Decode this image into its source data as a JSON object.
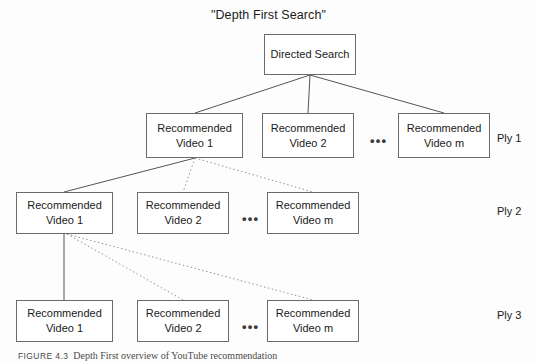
{
  "figure": {
    "title": "\"Depth First Search\"",
    "caption_number": "FIGURE 4.3",
    "caption_text": "Depth First overview of YouTube recommendation",
    "ellipsis": "•••"
  },
  "root": {
    "label": "Directed Search",
    "x": 264,
    "y": 34,
    "w": 92,
    "h": 41
  },
  "plies": [
    {
      "label": "Ply 1",
      "label_x": 497,
      "label_y": 132,
      "box_y": 113,
      "box_h": 45,
      "nodes": [
        {
          "line1": "Recommended",
          "line2": "Video 1",
          "x": 146,
          "w": 97
        },
        {
          "line1": "Recommended",
          "line2": "Video 2",
          "x": 262,
          "w": 92
        },
        {
          "line1": "Recommended",
          "line2": "Video m",
          "x": 398,
          "w": 92
        }
      ],
      "ellipsis_x": 370,
      "ellipsis_y": 134
    },
    {
      "label": "Ply 2",
      "label_x": 497,
      "label_y": 205,
      "box_y": 192,
      "box_h": 42,
      "nodes": [
        {
          "line1": "Recommended",
          "line2": "Video 1",
          "x": 16,
          "w": 97
        },
        {
          "line1": "Recommended",
          "line2": "Video 2",
          "x": 137,
          "w": 92
        },
        {
          "line1": "Recommended",
          "line2": "Video m",
          "x": 267,
          "w": 92
        }
      ],
      "ellipsis_x": 242,
      "ellipsis_y": 212
    },
    {
      "label": "Ply 3",
      "label_x": 497,
      "label_y": 309,
      "box_y": 300,
      "box_h": 42,
      "nodes": [
        {
          "line1": "Recommended",
          "line2": "Video 1",
          "x": 16,
          "w": 97
        },
        {
          "line1": "Recommended",
          "line2": "Video 2",
          "x": 137,
          "w": 92
        },
        {
          "line1": "Recommended",
          "line2": "Video m",
          "x": 267,
          "w": 92
        }
      ],
      "ellipsis_x": 242,
      "ellipsis_y": 320
    }
  ],
  "edges": [
    {
      "name": "root-to-ply1-video1",
      "x1": 310,
      "y1": 75,
      "x2": 195,
      "y2": 113,
      "style": "solid"
    },
    {
      "name": "root-to-ply1-video2",
      "x1": 310,
      "y1": 75,
      "x2": 308,
      "y2": 113,
      "style": "solid"
    },
    {
      "name": "root-to-ply1-videom",
      "x1": 310,
      "y1": 75,
      "x2": 444,
      "y2": 113,
      "style": "solid"
    },
    {
      "name": "ply1-video1-to-ply2-video1",
      "x1": 195,
      "y1": 158,
      "x2": 64,
      "y2": 192,
      "style": "solid"
    },
    {
      "name": "ply1-video1-to-ply2-video2",
      "x1": 195,
      "y1": 158,
      "x2": 183,
      "y2": 192,
      "style": "dotted"
    },
    {
      "name": "ply1-video1-to-ply2-videom",
      "x1": 195,
      "y1": 158,
      "x2": 313,
      "y2": 192,
      "style": "dotted"
    },
    {
      "name": "ply2-video1-to-ply3-video1",
      "x1": 64,
      "y1": 234,
      "x2": 64,
      "y2": 300,
      "style": "solid"
    },
    {
      "name": "ply2-video1-to-ply3-video2",
      "x1": 67,
      "y1": 234,
      "x2": 183,
      "y2": 300,
      "style": "dotted"
    },
    {
      "name": "ply2-video1-to-ply3-videom",
      "x1": 67,
      "y1": 234,
      "x2": 313,
      "y2": 300,
      "style": "dotted"
    }
  ]
}
